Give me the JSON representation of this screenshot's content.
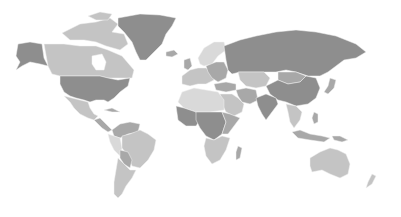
{
  "map": {
    "type": "world-choropleth",
    "style": "grayscale",
    "background": "#ffffff",
    "shades": {
      "dark": "#8e8e8e",
      "medium": "#a8a8a8",
      "light": "#c4c4c4",
      "pale": "#d9d9d9"
    },
    "regions": [
      {
        "name": "alaska",
        "shade": "dark"
      },
      {
        "name": "canada",
        "shade": "light"
      },
      {
        "name": "canadian-arctic-islands",
        "shade": "light"
      },
      {
        "name": "greenland",
        "shade": "dark"
      },
      {
        "name": "iceland",
        "shade": "medium"
      },
      {
        "name": "united-states",
        "shade": "dark"
      },
      {
        "name": "mexico",
        "shade": "light"
      },
      {
        "name": "central-america",
        "shade": "medium"
      },
      {
        "name": "cuba",
        "shade": "medium"
      },
      {
        "name": "colombia-venezuela",
        "shade": "medium"
      },
      {
        "name": "peru-ecuador",
        "shade": "pale"
      },
      {
        "name": "brazil",
        "shade": "light"
      },
      {
        "name": "bolivia-paraguay",
        "shade": "medium"
      },
      {
        "name": "argentina-chile",
        "shade": "light"
      },
      {
        "name": "scandinavia",
        "shade": "pale"
      },
      {
        "name": "western-europe",
        "shade": "light"
      },
      {
        "name": "eastern-europe",
        "shade": "medium"
      },
      {
        "name": "russia",
        "shade": "dark"
      },
      {
        "name": "kazakhstan-central-asia",
        "shade": "light"
      },
      {
        "name": "turkey-caucasus",
        "shade": "medium"
      },
      {
        "name": "middle-east",
        "shade": "light"
      },
      {
        "name": "iran",
        "shade": "medium"
      },
      {
        "name": "north-africa",
        "shade": "pale"
      },
      {
        "name": "west-africa",
        "shade": "dark"
      },
      {
        "name": "central-africa",
        "shade": "dark"
      },
      {
        "name": "east-africa",
        "shade": "medium"
      },
      {
        "name": "southern-africa",
        "shade": "light"
      },
      {
        "name": "madagascar",
        "shade": "medium"
      },
      {
        "name": "india",
        "shade": "dark"
      },
      {
        "name": "china",
        "shade": "dark"
      },
      {
        "name": "mongolia",
        "shade": "medium"
      },
      {
        "name": "southeast-asia",
        "shade": "light"
      },
      {
        "name": "japan",
        "shade": "medium"
      },
      {
        "name": "indonesia",
        "shade": "medium"
      },
      {
        "name": "philippines",
        "shade": "medium"
      },
      {
        "name": "papua-new-guinea",
        "shade": "medium"
      },
      {
        "name": "australia",
        "shade": "light"
      },
      {
        "name": "new-zealand",
        "shade": "light"
      },
      {
        "name": "uk-ireland",
        "shade": "medium"
      }
    ]
  }
}
